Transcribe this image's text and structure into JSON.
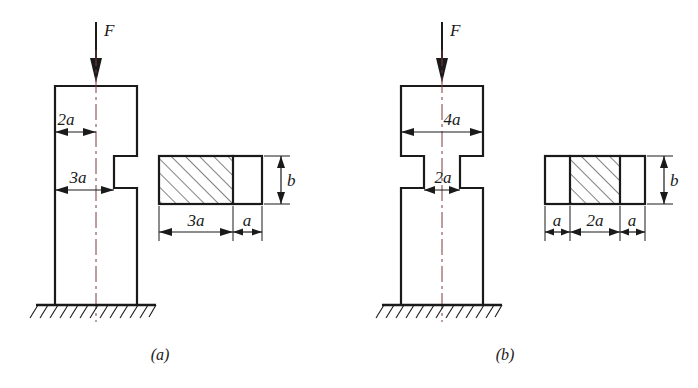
{
  "figure": {
    "background_color": "#ffffff",
    "line_color": "#1a1a1a",
    "centerline_color": "#7a3a3a"
  },
  "panels": [
    {
      "id": "panel-a",
      "caption": "(a)",
      "force_label": "F",
      "description": "Column with single-sided notch (asymmetric step)",
      "elevation_dimensions": [
        {
          "name": "dim-2a",
          "label": "2a",
          "meaning": "left-edge to centerline, upper portion"
        },
        {
          "name": "dim-3a",
          "label": "3a",
          "meaning": "left-edge to notch face, lower portion"
        }
      ],
      "cross_section": {
        "name": "section-a",
        "height_label": "b",
        "segments": [
          {
            "label": "3a",
            "hatched": true
          },
          {
            "label": "a",
            "hatched": false
          }
        ],
        "width_dimensions": [
          "3a",
          "a"
        ]
      }
    },
    {
      "id": "panel-b",
      "caption": "(b)",
      "force_label": "F",
      "description": "Column with symmetric two-sided notch (symmetric step)",
      "elevation_dimensions": [
        {
          "name": "dim-4a",
          "label": "4a",
          "meaning": "full width of upper portion"
        },
        {
          "name": "dim-2a",
          "label": "2a",
          "meaning": "width of necked (notched) portion"
        }
      ],
      "cross_section": {
        "name": "section-b",
        "height_label": "b",
        "segments": [
          {
            "label": "a",
            "hatched": false
          },
          {
            "label": "2a",
            "hatched": true
          },
          {
            "label": "a",
            "hatched": false
          }
        ],
        "width_dimensions": [
          "a",
          "2a",
          "a"
        ]
      }
    }
  ]
}
